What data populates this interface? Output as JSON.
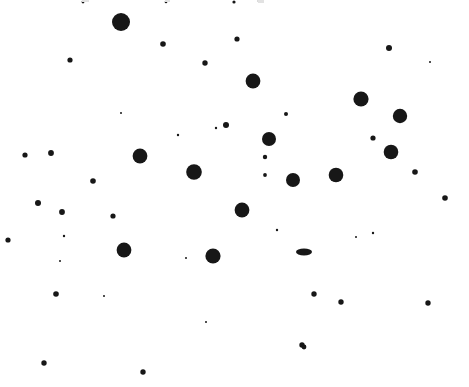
{
  "figure": {
    "title": "",
    "background_color": "#ffffff",
    "dot_color": "#171717",
    "width": 469,
    "height": 387
  },
  "chart_data": {
    "type": "scatter",
    "title": "",
    "xlabel": "",
    "ylabel": "",
    "xlim": [
      0,
      469
    ],
    "ylim": [
      0,
      387
    ],
    "grid": false,
    "legend": "none",
    "axes_visible": false,
    "marker_shape": "circle",
    "marker_color": "#171717",
    "n_points": 58,
    "size_units": "radius_px",
    "columns": [
      "x",
      "y",
      "r",
      "rx",
      "ry"
    ],
    "points": [
      {
        "x": 121,
        "y": 22,
        "r": 9.0
      },
      {
        "x": 70,
        "y": 60,
        "r": 2.6
      },
      {
        "x": 163,
        "y": 44,
        "r": 2.8
      },
      {
        "x": 205,
        "y": 63,
        "r": 2.7
      },
      {
        "x": 237,
        "y": 39,
        "r": 2.6
      },
      {
        "x": 253,
        "y": 81,
        "r": 7.4
      },
      {
        "x": 389,
        "y": 48,
        "r": 3.0
      },
      {
        "x": 361,
        "y": 99,
        "r": 7.6
      },
      {
        "x": 400,
        "y": 116,
        "r": 7.2
      },
      {
        "x": 226,
        "y": 125,
        "r": 3.0
      },
      {
        "x": 269,
        "y": 139,
        "r": 7.0
      },
      {
        "x": 373,
        "y": 138,
        "r": 2.6
      },
      {
        "x": 25,
        "y": 155,
        "r": 2.6
      },
      {
        "x": 51,
        "y": 153,
        "r": 2.9
      },
      {
        "x": 140,
        "y": 156,
        "r": 7.4
      },
      {
        "x": 391,
        "y": 152,
        "r": 7.3
      },
      {
        "x": 93,
        "y": 181,
        "r": 2.8
      },
      {
        "x": 194,
        "y": 172,
        "r": 7.8
      },
      {
        "x": 265,
        "y": 157,
        "r": 2.2
      },
      {
        "x": 265,
        "y": 175,
        "r": 1.9
      },
      {
        "x": 293,
        "y": 180,
        "r": 7.0
      },
      {
        "x": 336,
        "y": 175,
        "r": 7.3
      },
      {
        "x": 415,
        "y": 172,
        "r": 2.8
      },
      {
        "x": 38,
        "y": 203,
        "r": 3.0
      },
      {
        "x": 62,
        "y": 212,
        "r": 2.9
      },
      {
        "x": 113,
        "y": 216,
        "r": 2.6
      },
      {
        "x": 242,
        "y": 210,
        "r": 7.4
      },
      {
        "x": 8,
        "y": 240,
        "r": 2.6
      },
      {
        "x": 124,
        "y": 250,
        "r": 7.4
      },
      {
        "x": 213,
        "y": 256,
        "r": 7.6
      },
      {
        "x": 304,
        "y": 252,
        "rx": 8.0,
        "ry": 3.4
      },
      {
        "x": 445,
        "y": 198,
        "r": 2.8
      },
      {
        "x": 56,
        "y": 294,
        "r": 2.8
      },
      {
        "x": 314,
        "y": 294,
        "r": 2.7
      },
      {
        "x": 341,
        "y": 302,
        "r": 2.7
      },
      {
        "x": 428,
        "y": 303,
        "r": 2.7
      },
      {
        "x": 302,
        "y": 345,
        "r": 2.7
      },
      {
        "x": 44,
        "y": 363,
        "r": 2.7
      },
      {
        "x": 143,
        "y": 372,
        "r": 2.7
      },
      {
        "x": 304,
        "y": 347,
        "r": 2.4
      },
      {
        "x": 234,
        "y": 2,
        "r": 1.6
      },
      {
        "x": 286,
        "y": 114,
        "r": 2.0
      },
      {
        "x": 178,
        "y": 135,
        "r": 1.2
      },
      {
        "x": 64,
        "y": 236,
        "r": 1.2
      },
      {
        "x": 104,
        "y": 296,
        "r": 1.0
      },
      {
        "x": 305,
        "y": 253,
        "r": 1.0
      },
      {
        "x": 216,
        "y": 128,
        "r": 1.2
      },
      {
        "x": 373,
        "y": 233,
        "r": 1.2
      },
      {
        "x": 277,
        "y": 230,
        "r": 1.2
      },
      {
        "x": 83,
        "y": 2,
        "r": 1.4
      },
      {
        "x": 166,
        "y": 2,
        "r": 1.3
      },
      {
        "x": 259,
        "y": 1,
        "r": 1.3
      },
      {
        "x": 121,
        "y": 113,
        "r": 1.0
      },
      {
        "x": 186,
        "y": 258,
        "r": 1.0
      },
      {
        "x": 60,
        "y": 261,
        "r": 1.0
      },
      {
        "x": 430,
        "y": 62,
        "r": 1.0
      },
      {
        "x": 206,
        "y": 322,
        "r": 1.0
      },
      {
        "x": 356,
        "y": 237,
        "r": 1.0
      }
    ],
    "top_edge_artifacts": [
      {
        "x": 82,
        "y": 0,
        "w": 7,
        "h": 2
      },
      {
        "x": 165,
        "y": 0,
        "w": 5,
        "h": 2
      },
      {
        "x": 258,
        "y": 0,
        "w": 6,
        "h": 3
      },
      {
        "x": 500,
        "y": 0,
        "w": 4,
        "h": 2
      }
    ]
  }
}
